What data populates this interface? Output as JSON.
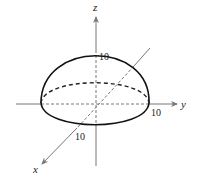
{
  "diagram": {
    "axes": {
      "x": {
        "label": "x"
      },
      "y": {
        "label": "y"
      },
      "z": {
        "label": "z"
      }
    },
    "intercepts": {
      "x": "10",
      "y": "10",
      "z": "10"
    },
    "colors": {
      "axis": "#777777",
      "surface_edge": "#111111",
      "hidden_edge": "#333333",
      "text": "#222222"
    }
  }
}
